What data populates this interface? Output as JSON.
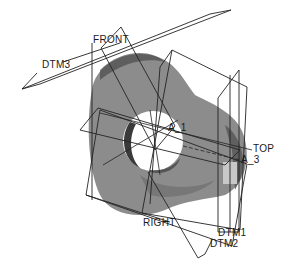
{
  "view": {
    "type": "3d-cad-model",
    "background": "#ffffff"
  },
  "model": {
    "body_color": "#8a8a8a",
    "body_dark": "#555555",
    "body_light": "#b8b8b8",
    "hole_color": "#ffffff"
  },
  "datum_planes": {
    "front": "FRONT",
    "dtm3": "DTM3",
    "top": "TOP",
    "right": "RIGHT",
    "dtm1": "DTM1",
    "dtm2": "DTM2"
  },
  "datum_axes": {
    "a1": "A_1",
    "a3": "A_3"
  }
}
